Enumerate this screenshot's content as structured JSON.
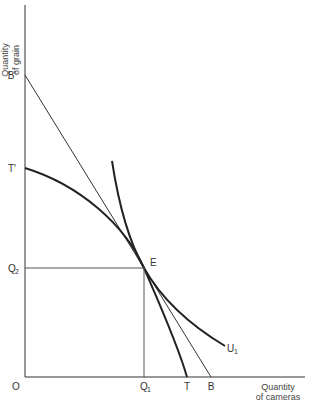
{
  "diagram": {
    "type": "production-possibility-with-indifference-curve",
    "axes": {
      "x_title_line1": "Quantity",
      "x_title_line2": "of cameras",
      "y_title_line1": "Quantity",
      "y_title_line2": "of grain",
      "origin_label": "O"
    },
    "points": {
      "B_prime": "B'",
      "T_prime": "T'",
      "Q2": "Q",
      "Q2_sub": "2",
      "Q1": "Q",
      "Q1_sub": "1",
      "T": "T",
      "B": "B",
      "E": "E",
      "U1": "U",
      "U1_sub": "1"
    },
    "curves": [
      {
        "name": "production-possibility-frontier",
        "from": "T'",
        "to": "T",
        "shape": "concave"
      },
      {
        "name": "budget-line",
        "from": "B'",
        "to": "B",
        "shape": "straight"
      },
      {
        "name": "indifference-curve",
        "label": "U1",
        "shape": "convex",
        "tangent_at": "E"
      }
    ],
    "colors": {
      "line": "#222222",
      "background": "#ffffff"
    }
  }
}
